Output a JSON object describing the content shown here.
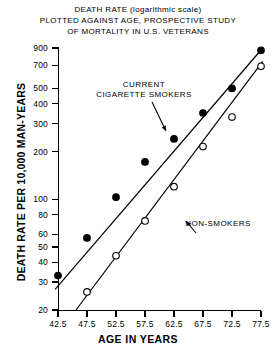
{
  "title": {
    "line1": "DEATH RATE (logarithmic scale)",
    "line2": "PLOTTED AGAINST AGE, PROSPECTIVE STUDY",
    "line3": "OF MORTALITY IN U.S. VETERANS"
  },
  "annotations": {
    "smokers_l1": "CURRENT",
    "smokers_l2": "CIGARETTE SMOKERS",
    "nonsmokers": "NON-SMOKERS"
  },
  "chart_data": {
    "type": "scatter",
    "title": "DEATH RATE (logarithmic scale) PLOTTED AGAINST AGE, PROSPECTIVE STUDY OF MORTALITY IN U.S. VETERANS",
    "xlabel": "AGE IN YEARS",
    "ylabel": "DEATH RATE PER 10,000 MAN-YEARS",
    "yscale": "log",
    "ylim": [
      20,
      900
    ],
    "xlim": [
      42.5,
      77.5
    ],
    "grid": false,
    "legend_position": "inline-annotation",
    "xticks": [
      "42.5",
      "47.5",
      "52.5",
      "57.5",
      "62.5",
      "67.5",
      "72.5",
      "77.5"
    ],
    "xtick_values": [
      42.5,
      47.5,
      52.5,
      57.5,
      62.5,
      67.5,
      72.5,
      77.5
    ],
    "yticks": [
      "900",
      "700",
      "500",
      "400",
      "300",
      "200",
      "100",
      "80",
      "60",
      "50",
      "40",
      "30",
      "20"
    ],
    "ytick_values": [
      900,
      700,
      500,
      400,
      300,
      200,
      100,
      80,
      60,
      50,
      40,
      30,
      20
    ],
    "series": [
      {
        "name": "CURRENT CIGARETTE SMOKERS",
        "marker": "filled-circle",
        "color": "#000000",
        "x": [
          42.5,
          47.5,
          52.5,
          57.5,
          62.5,
          67.5,
          72.5,
          77.5
        ],
        "y": [
          33,
          57,
          103,
          172,
          240,
          350,
          500,
          870
        ],
        "fit_line": {
          "x": [
            42.0,
            77.8
          ],
          "y": [
            27,
            900
          ]
        }
      },
      {
        "name": "NON-SMOKERS",
        "marker": "open-circle",
        "color": "#000000",
        "x": [
          47.5,
          52.5,
          57.5,
          62.5,
          67.5,
          72.5,
          77.5
        ],
        "y": [
          26,
          44,
          73,
          120,
          215,
          330,
          690
        ],
        "fit_line": {
          "x": [
            45.6,
            77.8
          ],
          "y": [
            20,
            740
          ]
        }
      }
    ]
  }
}
